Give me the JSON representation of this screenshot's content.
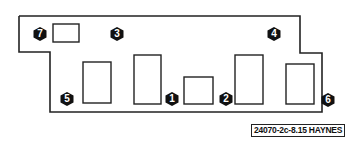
{
  "diagram": {
    "caption": "24070-2c-8.15 HAYNES",
    "outline_color": "#222222",
    "badge_color": "#111111",
    "callouts": [
      {
        "id": "7",
        "label": "7",
        "x": 33,
        "y": 27
      },
      {
        "id": "3",
        "label": "3",
        "x": 110,
        "y": 27
      },
      {
        "id": "4",
        "label": "4",
        "x": 267,
        "y": 27
      },
      {
        "id": "5",
        "label": "5",
        "x": 60,
        "y": 92
      },
      {
        "id": "1",
        "label": "1",
        "x": 165,
        "y": 92
      },
      {
        "id": "2",
        "label": "2",
        "x": 219,
        "y": 92
      },
      {
        "id": "6",
        "label": "6",
        "x": 321,
        "y": 93
      }
    ]
  }
}
